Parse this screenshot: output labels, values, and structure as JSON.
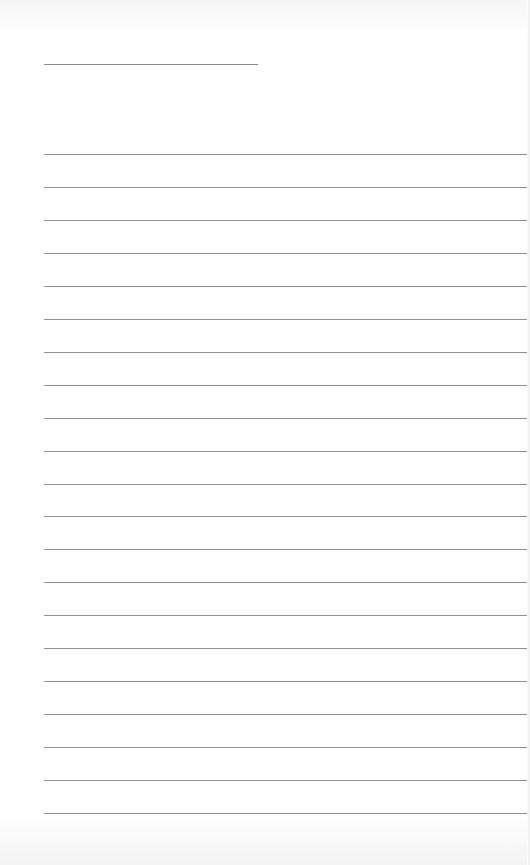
{
  "page": {
    "type": "lined-paper",
    "background_color": "#ffffff",
    "line_color": "#8f8f8f",
    "title_line": {
      "top": 64,
      "left": 44,
      "width": 214
    },
    "rules": {
      "count": 21,
      "first_top": 154,
      "spacing": 32.95,
      "left": 44,
      "width": 484
    }
  }
}
